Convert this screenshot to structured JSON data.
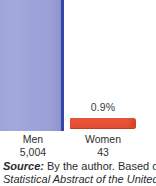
{
  "chart_data": {
    "type": "bar",
    "categories": [
      "Men",
      "Women"
    ],
    "values": [
      5004,
      43
    ],
    "value_labels": [
      "5,004",
      "43"
    ],
    "data_labels": [
      "",
      "0.9%"
    ],
    "series": [
      {
        "name": "Count",
        "values": [
          5004,
          43
        ],
        "colors": [
          "#9fa5da",
          "#e5502f"
        ]
      }
    ],
    "title": "",
    "subtitle": "",
    "xlabel": "",
    "ylabel": "",
    "grid": false,
    "legend": "none",
    "annotations": [
      "0.9%"
    ]
  },
  "chart": {
    "bars": [
      {
        "category": "Men",
        "value_label": "5,004",
        "pct_label": "",
        "color": "#9fa5da",
        "edge_color": "#3246a6"
      },
      {
        "category": "Women",
        "value_label": "43",
        "pct_label": "0.9%",
        "color": "#e5502f",
        "edge_color": "#d94527"
      }
    ]
  },
  "source": {
    "lead": "Source:",
    "line1_rest": " By the author. Based on",
    "line2": "Statistical Abstract of the United"
  },
  "colors": {
    "bar_blue": "#9fa5da",
    "bar_blue_edge": "#3246a6",
    "bar_red": "#e5502f",
    "text": "#2f2f2f",
    "background": "#ffffff"
  }
}
